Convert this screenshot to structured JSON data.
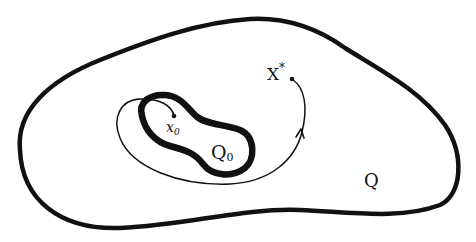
{
  "diagram": {
    "type": "set-trajectory-sketch",
    "colors": {
      "stroke": "#111111",
      "background": "#ffffff"
    },
    "regions": [
      {
        "id": "Q",
        "label": "Q",
        "description": "outer region (thick closed curve)"
      },
      {
        "id": "Q0",
        "label": "Q",
        "subscript": "0",
        "description": "inner peanut-shaped region (very thick closed curve)"
      }
    ],
    "points": [
      {
        "id": "x0",
        "label": "x",
        "subscript": "0",
        "description": "starting point inside Q0"
      },
      {
        "id": "xstar",
        "label": "X",
        "superscript": "*",
        "description": "target point inside Q"
      }
    ],
    "trajectory": {
      "from": "x0",
      "to": "xstar",
      "arrow": true,
      "description": "curve leaving Q0, looping around it, and ending at X*"
    }
  }
}
